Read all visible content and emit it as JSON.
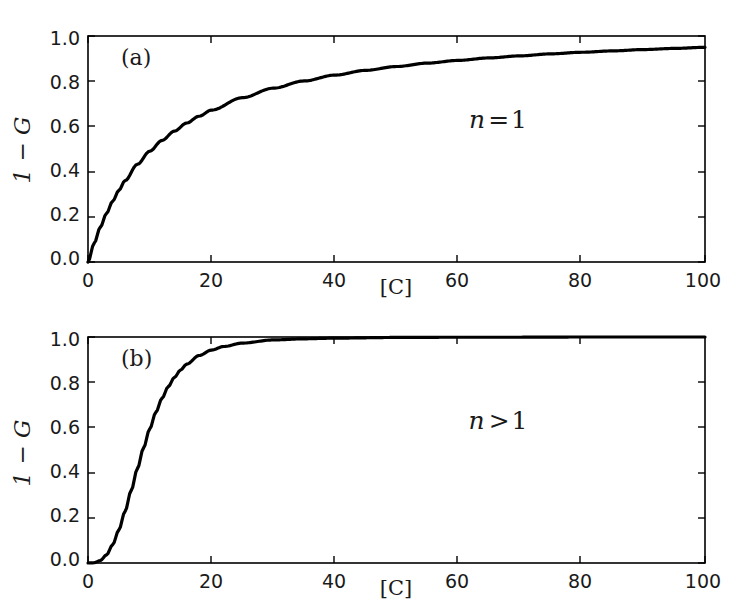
{
  "figure": {
    "background_color": "#ffffff",
    "line_color": "#000000",
    "axis_color": "#000000",
    "panels": [
      {
        "id": "a",
        "panel_label": "(a)",
        "annotation": "n = 1"
      },
      {
        "id": "b",
        "panel_label": "(b)",
        "annotation": "n > 1"
      }
    ]
  },
  "chart_data": [
    {
      "type": "line",
      "id": "panel-a",
      "title": "",
      "panel_label": "(a)",
      "annotation": "n = 1",
      "xlabel": "[C]",
      "ylabel": "1 - G",
      "xlim": [
        0,
        100
      ],
      "ylim": [
        0,
        1.0
      ],
      "xticks": [
        0,
        20,
        40,
        60,
        80,
        100
      ],
      "xtick_labels": [
        "0",
        "20",
        "40",
        "60",
        "80",
        "100"
      ],
      "yticks": [
        0.0,
        0.2,
        0.4,
        0.6,
        0.8,
        1.0
      ],
      "ytick_labels": [
        "0.0",
        "0.2",
        "0.4",
        "0.6",
        "0.8",
        "1.0"
      ],
      "grid": false,
      "legend": false,
      "series": [
        {
          "name": "1-G (n=1)",
          "color": "#000000",
          "linewidth": 3.2,
          "x": [
            0,
            1,
            2,
            3,
            4,
            5,
            6,
            8,
            10,
            12,
            14,
            16,
            18,
            20,
            25,
            30,
            35,
            40,
            45,
            50,
            55,
            60,
            65,
            70,
            75,
            80,
            85,
            90,
            95,
            100
          ],
          "y": [
            0.0,
            0.083,
            0.154,
            0.215,
            0.269,
            0.317,
            0.36,
            0.432,
            0.49,
            0.538,
            0.579,
            0.615,
            0.645,
            0.672,
            0.727,
            0.769,
            0.801,
            0.827,
            0.848,
            0.865,
            0.88,
            0.892,
            0.903,
            0.912,
            0.921,
            0.928,
            0.934,
            0.94,
            0.945,
            0.95
          ]
        }
      ]
    },
    {
      "type": "line",
      "id": "panel-b",
      "title": "",
      "panel_label": "(b)",
      "annotation": "n > 1",
      "xlabel": "[C]",
      "ylabel": "1 - G",
      "xlim": [
        0,
        100
      ],
      "ylim": [
        0,
        1.0
      ],
      "xticks": [
        0,
        20,
        40,
        60,
        80,
        100
      ],
      "xtick_labels": [
        "0",
        "20",
        "40",
        "60",
        "80",
        "100"
      ],
      "yticks": [
        0.0,
        0.2,
        0.4,
        0.6,
        0.8,
        1.0
      ],
      "ytick_labels": [
        "0.0",
        "0.2",
        "0.4",
        "0.6",
        "0.8",
        "1.0"
      ],
      "grid": false,
      "legend": false,
      "series": [
        {
          "name": "1-G (n>1)",
          "color": "#000000",
          "linewidth": 3.2,
          "x": [
            0,
            1,
            2,
            3,
            4,
            5,
            6,
            7,
            8,
            9,
            10,
            11,
            12,
            13,
            14,
            15,
            16,
            18,
            20,
            22,
            25,
            30,
            35,
            40,
            50,
            60,
            70,
            80,
            90,
            100
          ],
          "y": [
            0.0,
            0.001,
            0.011,
            0.036,
            0.081,
            0.146,
            0.228,
            0.321,
            0.417,
            0.509,
            0.593,
            0.667,
            0.729,
            0.78,
            0.821,
            0.854,
            0.88,
            0.918,
            0.942,
            0.958,
            0.973,
            0.987,
            0.992,
            0.995,
            0.998,
            0.999,
            0.999,
            1.0,
            1.0,
            1.0
          ]
        }
      ]
    }
  ]
}
